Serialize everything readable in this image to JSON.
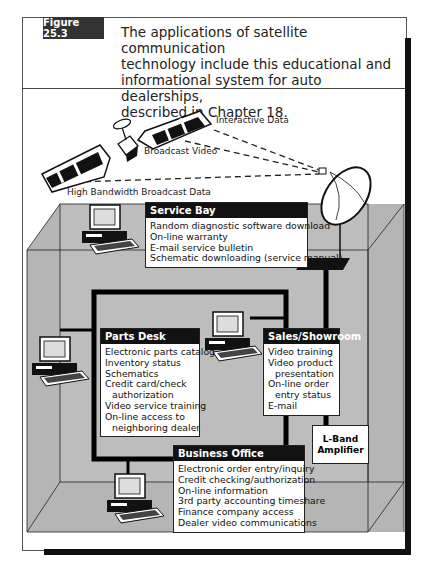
{
  "figure": {
    "tag": "Figure 25.3",
    "caption_lines": [
      "The applications of satellite communication",
      "technology include this educational and",
      "informational system for auto dealerships,",
      "described in Chapter 18."
    ]
  },
  "signals": {
    "interactive": "Interactive Data",
    "broadcast_video": "Broadcast Video",
    "high_bandwidth": "High Bandwidth Broadcast Data"
  },
  "stations": {
    "service_bay": {
      "title": "Service Bay",
      "items": [
        {
          "text": "Random diagnostic software download",
          "indent": false
        },
        {
          "text": "On-line warranty",
          "indent": false
        },
        {
          "text": "E-mail service bulletin",
          "indent": false
        },
        {
          "text": "Schematic downloading (service manual)",
          "indent": false
        }
      ]
    },
    "parts_desk": {
      "title": "Parts Desk",
      "items": [
        {
          "text": "Electronic parts catalog",
          "indent": false
        },
        {
          "text": "Inventory status",
          "indent": false
        },
        {
          "text": "Schematics",
          "indent": false
        },
        {
          "text": "Credit card/check",
          "indent": false
        },
        {
          "text": "authorization",
          "indent": true
        },
        {
          "text": "Video service training",
          "indent": false
        },
        {
          "text": "On-line access to",
          "indent": false
        },
        {
          "text": "neighboring dealer",
          "indent": true
        }
      ]
    },
    "sales": {
      "title": "Sales/Showroom",
      "items": [
        {
          "text": "Video training",
          "indent": false
        },
        {
          "text": "Video product",
          "indent": false
        },
        {
          "text": "presentation",
          "indent": true
        },
        {
          "text": "On-line order",
          "indent": false
        },
        {
          "text": "entry status",
          "indent": true
        },
        {
          "text": "E-mail",
          "indent": false
        }
      ]
    },
    "business_office": {
      "title": "Business Office",
      "items": [
        {
          "text": "Electronic order entry/inquiry",
          "indent": false
        },
        {
          "text": "Credit checking/authorization",
          "indent": false
        },
        {
          "text": "On-line information",
          "indent": false
        },
        {
          "text": "3rd party accounting timeshare",
          "indent": false
        },
        {
          "text": "Finance company access",
          "indent": false
        },
        {
          "text": "Dealer video communications",
          "indent": false
        }
      ]
    }
  },
  "amplifier": {
    "line1": "L-Band",
    "line2": "Amplifier"
  },
  "icons": [
    "satellite-icon",
    "satellite-dish-icon",
    "computer-icon"
  ],
  "colors": {
    "room_gray": "#b8b8b8",
    "room_dark": "#a5a5a5",
    "header_black": "#111111",
    "tag_bg": "#333333"
  }
}
